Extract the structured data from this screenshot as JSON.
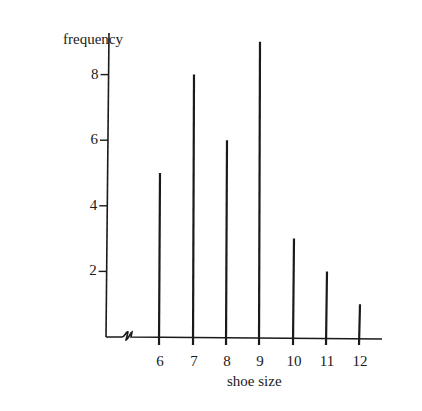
{
  "chart_data": {
    "type": "bar",
    "subtype": "vertical-line-graph",
    "title": "",
    "xlabel": "shoe size",
    "ylabel": "frequency",
    "categories": [
      "6",
      "7",
      "8",
      "9",
      "10",
      "11",
      "12"
    ],
    "values": [
      5,
      8,
      6,
      9,
      3,
      2,
      1
    ],
    "yticks": [
      2,
      4,
      6,
      8
    ],
    "ylim": [
      0,
      9.5
    ],
    "x_axis_break": true,
    "grid": false,
    "legend": null
  },
  "layout": {
    "origin_x": 106,
    "baseline_y": 337,
    "axis_top_y": 33,
    "axis_right_x": 382,
    "px_per_unit": 32.8,
    "bar_x": [
      160,
      194,
      227,
      260,
      294,
      327,
      360
    ],
    "ink": "#1a1a1a"
  }
}
